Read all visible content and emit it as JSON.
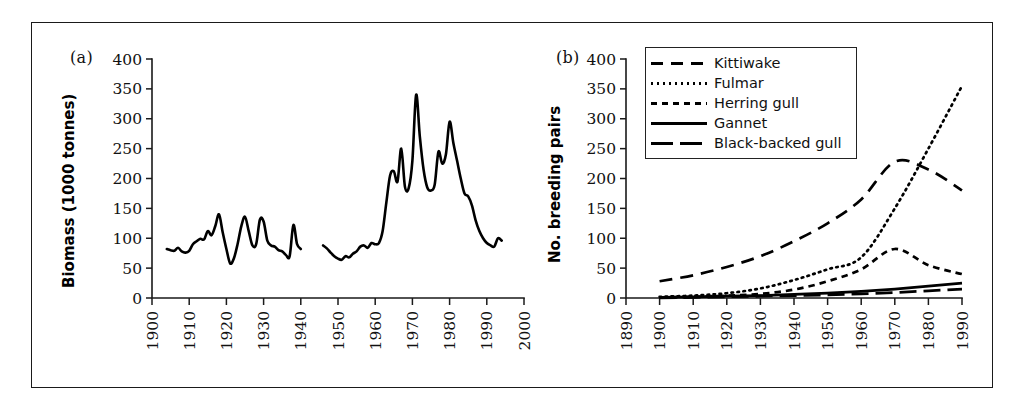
{
  "figure": {
    "background": "#ffffff",
    "frame_color": "#1a1a1a",
    "line_color": "#000000"
  },
  "panel_a": {
    "letter": "(a)",
    "ylabel": "Biomass (1000 tonnes)",
    "yticks": [
      0,
      50,
      100,
      150,
      200,
      250,
      300,
      350,
      400
    ],
    "xticks": [
      1900,
      1910,
      1920,
      1930,
      1940,
      1950,
      1960,
      1970,
      1980,
      1990,
      2000
    ]
  },
  "panel_b": {
    "letter": "(b)",
    "ylabel": "No. breeding pairs",
    "yticks": [
      0,
      50,
      100,
      150,
      200,
      250,
      300,
      350,
      400
    ],
    "xticks": [
      1890,
      1900,
      1910,
      1920,
      1930,
      1940,
      1950,
      1960,
      1970,
      1980,
      1990
    ],
    "legend": [
      {
        "label": "Kittiwake",
        "style": "long-dash"
      },
      {
        "label": "Fulmar",
        "style": "dotted"
      },
      {
        "label": "Herring gull",
        "style": "short-dash"
      },
      {
        "label": "Gannet",
        "style": "solid"
      },
      {
        "label": "Black-backed gull",
        "style": "medium-dash"
      }
    ]
  },
  "chart_data": [
    {
      "type": "line",
      "panel": "(a)",
      "title": "",
      "xlabel": "",
      "ylabel": "Biomass (1000 tonnes)",
      "xlim": [
        1900,
        2000
      ],
      "ylim": [
        0,
        400
      ],
      "xticks": [
        1900,
        1910,
        1920,
        1930,
        1940,
        1950,
        1960,
        1970,
        1980,
        1990,
        2000
      ],
      "yticks": [
        0,
        50,
        100,
        150,
        200,
        250,
        300,
        350,
        400
      ],
      "grid": false,
      "legend": "none",
      "series": [
        {
          "name": "Biomass segment 1",
          "x": [
            1904,
            1905,
            1906,
            1907,
            1908,
            1909,
            1910,
            1911,
            1912,
            1913,
            1914,
            1915,
            1916,
            1917,
            1918,
            1919,
            1920,
            1921,
            1922,
            1923,
            1924,
            1925,
            1926,
            1927,
            1928,
            1929,
            1930,
            1931,
            1932,
            1933,
            1934,
            1935,
            1936,
            1937,
            1938,
            1939,
            1940
          ],
          "values": [
            82,
            80,
            79,
            84,
            78,
            76,
            79,
            90,
            95,
            99,
            98,
            112,
            105,
            120,
            140,
            110,
            82,
            58,
            66,
            90,
            120,
            136,
            112,
            88,
            90,
            131,
            128,
            96,
            88,
            86,
            80,
            78,
            72,
            70,
            122,
            90,
            82
          ]
        },
        {
          "name": "Biomass segment 2",
          "x": [
            1946,
            1947,
            1948,
            1949,
            1950,
            1951,
            1952,
            1953,
            1954,
            1955,
            1956,
            1957,
            1958,
            1959,
            1960,
            1961,
            1962,
            1963,
            1964,
            1965,
            1966,
            1967,
            1968,
            1969,
            1970,
            1971,
            1972,
            1973,
            1974,
            1975,
            1976,
            1977,
            1978,
            1979,
            1980,
            1981,
            1982,
            1983,
            1984,
            1985,
            1986,
            1987,
            1988,
            1989,
            1990,
            1991,
            1992,
            1993,
            1994
          ],
          "values": [
            88,
            83,
            76,
            70,
            66,
            64,
            70,
            68,
            74,
            78,
            86,
            88,
            84,
            92,
            90,
            92,
            112,
            160,
            205,
            212,
            195,
            250,
            186,
            184,
            230,
            340,
            270,
            215,
            185,
            180,
            190,
            245,
            225,
            240,
            295,
            260,
            230,
            200,
            175,
            170,
            155,
            130,
            112,
            100,
            92,
            88,
            86,
            100,
            96
          ]
        }
      ]
    },
    {
      "type": "line",
      "panel": "(b)",
      "title": "",
      "xlabel": "",
      "ylabel": "No. breeding pairs",
      "xlim": [
        1890,
        1990
      ],
      "ylim": [
        0,
        400
      ],
      "xticks": [
        1890,
        1900,
        1910,
        1920,
        1930,
        1940,
        1950,
        1960,
        1970,
        1980,
        1990
      ],
      "yticks": [
        0,
        50,
        100,
        150,
        200,
        250,
        300,
        350,
        400
      ],
      "grid": false,
      "legend": "upper-left",
      "x": [
        1900,
        1910,
        1920,
        1930,
        1940,
        1950,
        1960,
        1970,
        1980,
        1990
      ],
      "series": [
        {
          "name": "Kittiwake",
          "values": [
            28,
            38,
            52,
            70,
            95,
            125,
            165,
            228,
            215,
            180
          ]
        },
        {
          "name": "Fulmar",
          "values": [
            2,
            4,
            8,
            16,
            30,
            48,
            68,
            150,
            250,
            355
          ]
        },
        {
          "name": "Herring gull",
          "values": [
            1,
            2,
            4,
            7,
            14,
            28,
            48,
            82,
            55,
            40
          ]
        },
        {
          "name": "Gannet",
          "values": [
            1,
            2,
            3,
            4,
            6,
            8,
            11,
            15,
            20,
            25
          ]
        },
        {
          "name": "Black-backed gull",
          "values": [
            0,
            1,
            2,
            3,
            4,
            5,
            7,
            9,
            12,
            15
          ]
        }
      ]
    }
  ]
}
